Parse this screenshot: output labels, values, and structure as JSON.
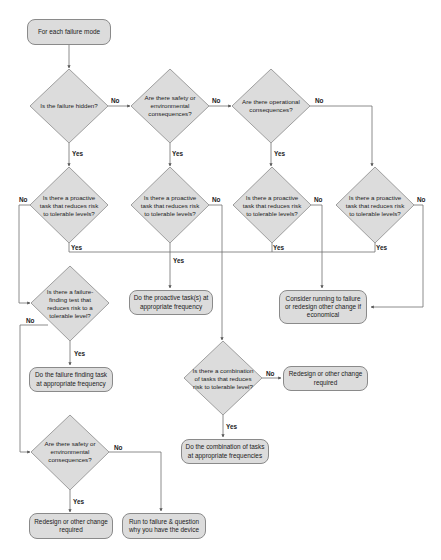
{
  "diagram": {
    "type": "flowchart",
    "colors": {
      "node_fill": "#dcdcdc",
      "node_border": "#8a8a8a",
      "line": "#6e6e6e",
      "text": "#222222"
    },
    "start": {
      "id": "start",
      "label": "For each failure mode"
    },
    "decisions": [
      {
        "id": "d_hidden",
        "label": "Is the failure hidden?"
      },
      {
        "id": "d_safety1",
        "label": "Are there safety or environmental consequences?"
      },
      {
        "id": "d_operational",
        "label": "Are there operational consequences?"
      },
      {
        "id": "d_proactive1",
        "label": "Is there a proactive task that reduces risk to tolerable levels?"
      },
      {
        "id": "d_proactive2",
        "label": "Is there a proactive task that reduces risk to tolerable levels?"
      },
      {
        "id": "d_proactive3",
        "label": "Is there a proactive task that reduces risk to tolerable levels?"
      },
      {
        "id": "d_proactive4",
        "label": "Is there a proactive task that reduces risk to tolerable levels?"
      },
      {
        "id": "d_failfind",
        "label": "Is there a failure-finding test that reduces risk to a tolerable level?"
      },
      {
        "id": "d_combination",
        "label": "Is there a combination of tasks that reduces risk to tolerable level?"
      },
      {
        "id": "d_safety2",
        "label": "Are there safety or environmental consequences?"
      }
    ],
    "actions": [
      {
        "id": "a_proactive",
        "label": "Do the proactive task(s) at appropriate frequency"
      },
      {
        "id": "a_consider",
        "label": "Consider running to failure or redesign other change if economical"
      },
      {
        "id": "a_failfind",
        "label": "Do the failure finding task at appropriate frequency"
      },
      {
        "id": "a_redesign1",
        "label": "Redesign or other change required"
      },
      {
        "id": "a_combination",
        "label": "Do the combination of tasks at appropriate frequencies"
      },
      {
        "id": "a_redesign2",
        "label": "Redesign or other change required"
      },
      {
        "id": "a_runtofail",
        "label": "Run to failure & question why you have the device"
      }
    ],
    "edge_labels": {
      "yes": "Yes",
      "no": "No"
    },
    "edges": [
      {
        "from": "start",
        "to": "d_hidden",
        "label": ""
      },
      {
        "from": "d_hidden",
        "to": "d_safety1",
        "label": "No"
      },
      {
        "from": "d_safety1",
        "to": "d_operational",
        "label": "No"
      },
      {
        "from": "d_operational",
        "to": "d_proactive4",
        "label": "No"
      },
      {
        "from": "d_hidden",
        "to": "d_proactive1",
        "label": "Yes"
      },
      {
        "from": "d_safety1",
        "to": "d_proactive2",
        "label": "Yes"
      },
      {
        "from": "d_operational",
        "to": "d_proactive3",
        "label": "Yes"
      },
      {
        "from": "d_proactive1",
        "to": "a_proactive",
        "label": "Yes"
      },
      {
        "from": "d_proactive2",
        "to": "a_proactive",
        "label": "Yes"
      },
      {
        "from": "d_proactive3",
        "to": "a_proactive",
        "label": "Yes"
      },
      {
        "from": "d_proactive4",
        "to": "a_proactive",
        "label": "Yes"
      },
      {
        "from": "d_proactive1",
        "to": "d_failfind",
        "label": "No"
      },
      {
        "from": "d_proactive2",
        "to": "d_combination",
        "label": "No"
      },
      {
        "from": "d_proactive3",
        "to": "a_consider",
        "label": "No"
      },
      {
        "from": "d_proactive4",
        "to": "a_consider",
        "label": "No"
      },
      {
        "from": "d_failfind",
        "to": "a_failfind",
        "label": "Yes"
      },
      {
        "from": "d_failfind",
        "to": "d_safety2",
        "label": "No"
      },
      {
        "from": "d_combination",
        "to": "a_redesign1",
        "label": "No"
      },
      {
        "from": "d_combination",
        "to": "a_combination",
        "label": "Yes"
      },
      {
        "from": "d_safety2",
        "to": "a_redesign2",
        "label": "Yes"
      },
      {
        "from": "d_safety2",
        "to": "a_runtofail",
        "label": "No"
      }
    ]
  }
}
